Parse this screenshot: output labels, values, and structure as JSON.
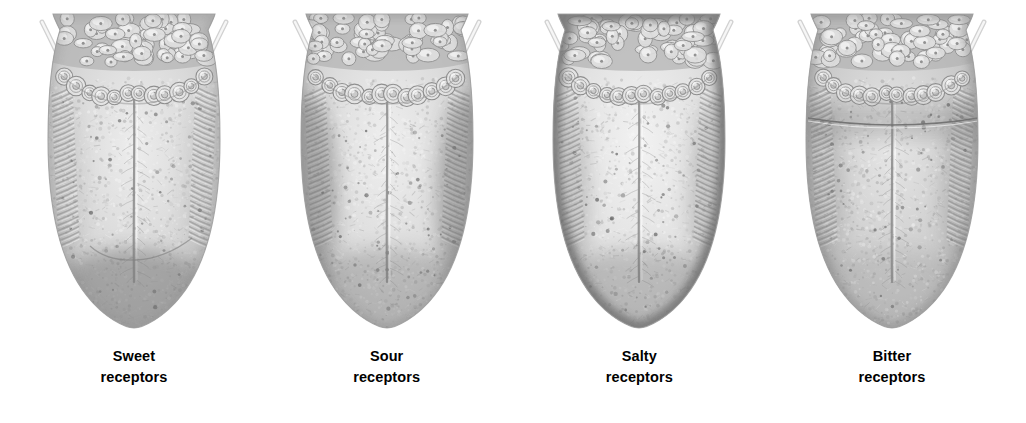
{
  "figure": {
    "type": "anatomical-illustration",
    "style": "grayscale pencil/stipple rendering",
    "background_color": "#ffffff",
    "panel_count": 4,
    "caption_color": "#000000"
  },
  "panels": [
    {
      "id": "sweet",
      "label_line1": "Sweet",
      "label_line2": "receptors",
      "region_highlighted": "anterior tip",
      "shading": {
        "body": "#d9d9d9",
        "mid": "#c6c6c6",
        "edge": "#9a9a9a",
        "dark": "#7c7c7c",
        "highlight": "#ededed"
      },
      "features": {
        "tip_shading": "strong",
        "lateral_shading": "light",
        "rim_shading": "light",
        "posterior_band": false,
        "tip_arc_line": true
      }
    },
    {
      "id": "sour",
      "label_line1": "Sour",
      "label_line2": "receptors",
      "region_highlighted": "lateral sides",
      "shading": {
        "body": "#dcdcdc",
        "mid": "#c9c9c9",
        "edge": "#8d8d8d",
        "dark": "#6f6f6f",
        "highlight": "#efefef"
      },
      "features": {
        "tip_shading": "medium",
        "lateral_shading": "strong",
        "rim_shading": "light",
        "posterior_band": false,
        "tip_arc_line": false
      }
    },
    {
      "id": "salty",
      "label_line1": "Salty",
      "label_line2": "receptors",
      "region_highlighted": "edges / rim",
      "shading": {
        "body": "#e2e2e2",
        "mid": "#d0d0d0",
        "edge": "#8a8a8a",
        "dark": "#6c6c6c",
        "highlight": "#f2f2f2"
      },
      "features": {
        "tip_shading": "medium",
        "lateral_shading": "medium",
        "rim_shading": "strong",
        "posterior_band": false,
        "tip_arc_line": false
      }
    },
    {
      "id": "bitter",
      "label_line1": "Bitter",
      "label_line2": "receptors",
      "region_highlighted": "posterior region",
      "shading": {
        "body": "#cfcfcf",
        "mid": "#bdbdbd",
        "edge": "#989898",
        "dark": "#7a7a7a",
        "highlight": "#e6e6e6"
      },
      "features": {
        "tip_shading": "light",
        "lateral_shading": "medium",
        "rim_shading": "medium",
        "posterior_band": true,
        "tip_arc_line": false
      }
    }
  ],
  "anatomy": {
    "lingual_tonsil_label": "lingual tonsil nodules",
    "circumvallate_label": "circumvallate papillae",
    "foliate_label": "foliate papillae",
    "median_sulcus_label": "median sulcus",
    "palatoglossal_arch_label": "palatoglossal arch"
  }
}
